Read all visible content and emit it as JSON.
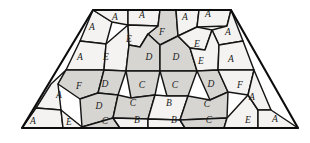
{
  "figure": {
    "background_color": "#ffffff",
    "outline_color": "#0d0d0d",
    "stroke_color": "#151515",
    "shade_light": "#f4f3f1",
    "shade_dark": "#d6d5d2",
    "outline_shape": "trapezoid",
    "outline_points": "93,10 231,10 298,128 22,128"
  },
  "legend": {
    "tile_types": [
      "A",
      "B",
      "C",
      "D",
      "E",
      "F"
    ]
  },
  "tiles": [
    {
      "id": "t01",
      "label": "A",
      "shade": "light",
      "lx": 92,
      "ly": 28,
      "pts": "93,10 112,22 106,44 80,41"
    },
    {
      "id": "t02",
      "label": "A",
      "shade": "light",
      "lx": 115,
      "ly": 18,
      "pts": "93,10 128,10 128,25 112,22"
    },
    {
      "id": "t03",
      "label": "A",
      "shade": "light",
      "lx": 142,
      "ly": 16,
      "pts": "128,10 160,10 158,26 128,25"
    },
    {
      "id": "t04",
      "label": "F",
      "shade": "shade",
      "lx": 162,
      "ly": 33,
      "pts": "160,10 176,10 178,36 160,45 148,34 158,26"
    },
    {
      "id": "t05",
      "label": "A",
      "shade": "light",
      "lx": 185,
      "ly": 18,
      "pts": "176,10 199,10 197,27 178,36"
    },
    {
      "id": "t06",
      "label": "A",
      "shade": "light",
      "lx": 208,
      "ly": 15,
      "pts": "199,10 231,10 227,26 197,27"
    },
    {
      "id": "t07",
      "label": "A",
      "shade": "light",
      "lx": 228,
      "ly": 33,
      "pts": "231,10 243,41 219,45 212,30 227,26"
    },
    {
      "id": "t08",
      "label": "A",
      "shade": "light",
      "lx": 80,
      "ly": 58,
      "pts": "80,41 106,44 104,70 66,70"
    },
    {
      "id": "t09",
      "label": "E",
      "shade": "light",
      "lx": 106,
      "ly": 58,
      "pts": "106,44 128,25 129,45 126,71 104,70"
    },
    {
      "id": "t10",
      "label": "E",
      "shade": "light",
      "lx": 129,
      "ly": 40,
      "pts": "128,25 158,26 148,34 140,47 129,45"
    },
    {
      "id": "t11",
      "label": "D",
      "shade": "shade",
      "lx": 149,
      "ly": 58,
      "pts": "129,45 140,47 148,34 160,45 160,71 126,71"
    },
    {
      "id": "t12",
      "label": "D",
      "shade": "shade",
      "lx": 176,
      "ly": 58,
      "pts": "160,45 178,36 190,48 197,71 160,71"
    },
    {
      "id": "t13",
      "label": "E",
      "shade": "light",
      "lx": 197,
      "ly": 45,
      "pts": "178,36 197,27 212,30 205,50 190,48"
    },
    {
      "id": "t14",
      "label": "E",
      "shade": "light",
      "lx": 201,
      "ly": 62,
      "pts": "190,48 205,50 212,30 219,45 218,70 197,71"
    },
    {
      "id": "t15",
      "label": "A",
      "shade": "light",
      "lx": 231,
      "ly": 60,
      "pts": "219,45 243,41 254,70 218,70"
    },
    {
      "id": "t16",
      "label": "A",
      "shade": "light",
      "lx": 59,
      "ly": 96,
      "pts": "66,70 58,84 61,110 36,108 51,84"
    },
    {
      "id": "t17",
      "label": "F",
      "shade": "shade",
      "lx": 79,
      "ly": 87,
      "pts": "66,70 104,70 98,93 80,99 58,84"
    },
    {
      "id": "t18",
      "label": "D",
      "shade": "shade",
      "lx": 105,
      "ly": 85,
      "pts": "104,70 126,71 118,95 98,93"
    },
    {
      "id": "t19",
      "label": "C",
      "shade": "shade",
      "lx": 142,
      "ly": 86,
      "pts": "126,71 160,71 155,95 131,98"
    },
    {
      "id": "t20",
      "label": "C",
      "shade": "shade",
      "lx": 175,
      "ly": 86,
      "pts": "160,71 197,71 188,96 167,96"
    },
    {
      "id": "t21",
      "label": "D",
      "shade": "shade",
      "lx": 211,
      "ly": 85,
      "pts": "197,71 218,70 228,92 210,100"
    },
    {
      "id": "t22",
      "label": "F",
      "shade": "light",
      "lx": 240,
      "ly": 86,
      "pts": "218,70 254,70 248,95 228,92"
    },
    {
      "id": "t23",
      "label": "D",
      "shade": "shade",
      "lx": 99,
      "ly": 107,
      "pts": "98,93 118,95 113,118 82,127 80,99"
    },
    {
      "id": "t24",
      "label": "C",
      "shade": "shade",
      "lx": 133,
      "ly": 104,
      "pts": "118,95 131,98 155,95 148,119 113,118"
    },
    {
      "id": "t25",
      "label": "B",
      "shade": "light",
      "lx": 169,
      "ly": 104,
      "pts": "155,95 167,96 188,96 180,120 148,119"
    },
    {
      "id": "t26",
      "label": "C",
      "shade": "shade",
      "lx": 207,
      "ly": 105,
      "pts": "188,96 210,100 228,92 227,118 180,120"
    },
    {
      "id": "t27",
      "label": "A",
      "shade": "light",
      "lx": 33,
      "ly": 122,
      "pts": "36,108 61,110 63,128 22,128"
    },
    {
      "id": "t28",
      "label": "E",
      "shade": "light",
      "lx": 69,
      "ly": 123,
      "pts": "61,110 82,127 82,128 63,128"
    },
    {
      "id": "t29",
      "label": "C",
      "shade": "shade",
      "lx": 105,
      "ly": 122,
      "pts": "82,127 113,118 120,128 82,128"
    },
    {
      "id": "t30",
      "label": "B",
      "shade": "light",
      "lx": 137,
      "ly": 121,
      "pts": "113,118 148,119 148,128 120,128"
    },
    {
      "id": "t31",
      "label": "B",
      "shade": "light",
      "lx": 174,
      "ly": 121,
      "pts": "148,119 180,120 185,128 148,128"
    },
    {
      "id": "t32",
      "label": "C",
      "shade": "shade",
      "lx": 209,
      "ly": 121,
      "pts": "180,120 227,118 224,128 185,128"
    },
    {
      "id": "t33",
      "label": "E",
      "shade": "light",
      "lx": 248,
      "ly": 121,
      "pts": "227,118 248,95 258,110 258,128 224,128"
    },
    {
      "id": "t34",
      "label": "A",
      "shade": "light",
      "lx": 252,
      "ly": 98,
      "pts": "248,95 254,70 271,110 258,110"
    },
    {
      "id": "t35",
      "label": "A",
      "shade": "light",
      "lx": 275,
      "ly": 120,
      "pts": "258,110 271,110 298,128 258,128"
    }
  ]
}
